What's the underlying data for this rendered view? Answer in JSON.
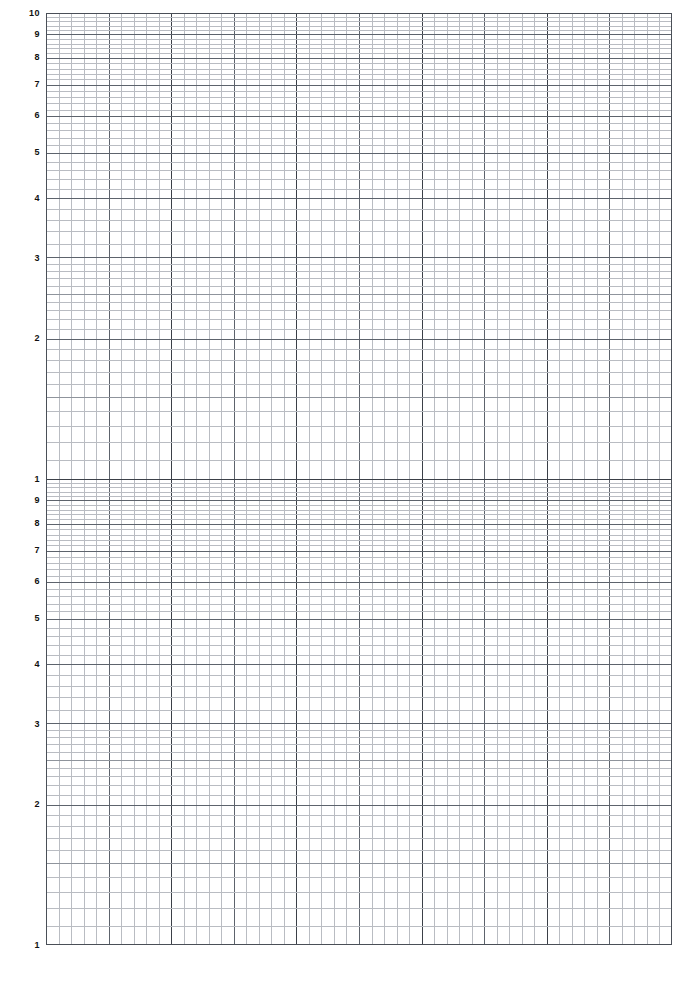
{
  "document": {
    "kind": "semi-logarithmic graph paper",
    "cycles": 2,
    "paper_color": "#ffffff"
  },
  "colors": {
    "paper": "#ffffff",
    "grid_minor": "#b9bcc2",
    "grid_mid": "#8f949c",
    "grid_major": "#5d636c",
    "grid_decade": "#3b4048",
    "border": "#4a4f57",
    "label": "#111111"
  },
  "plot": {
    "left": 46,
    "top": 13,
    "width": 626,
    "height": 932
  },
  "chart_data": {
    "type": "grid",
    "title": "",
    "subtitle": "",
    "xlabel": "",
    "ylabel": "",
    "grid": "on",
    "legend": "none",
    "annotations": [],
    "series": [],
    "x_axis": {
      "scale": "linear",
      "minor_divisions": 50,
      "major_every": 5,
      "tick_labels": []
    },
    "y_axis": {
      "scale": "log",
      "base": 10,
      "decades": 2,
      "range": [
        1,
        100
      ],
      "decade_breaks": [
        1,
        10,
        100
      ],
      "tick_labels": [
        {
          "text": "10",
          "value": 100,
          "y": 13
        },
        {
          "text": "9",
          "value": 90,
          "y": 34
        },
        {
          "text": "8",
          "value": 80,
          "y": 57
        },
        {
          "text": "7",
          "value": 70,
          "y": 84
        },
        {
          "text": "6",
          "value": 60,
          "y": 115
        },
        {
          "text": "5",
          "value": 50,
          "y": 152
        },
        {
          "text": "4",
          "value": 40,
          "y": 198
        },
        {
          "text": "3",
          "value": 30,
          "y": 258
        },
        {
          "text": "2",
          "value": 20,
          "y": 338
        },
        {
          "text": "1",
          "value": 10,
          "y": 479
        },
        {
          "text": "9",
          "value": 9,
          "y": 500
        },
        {
          "text": "8",
          "value": 8,
          "y": 523
        },
        {
          "text": "7",
          "value": 7,
          "y": 550
        },
        {
          "text": "6",
          "value": 6,
          "y": 581
        },
        {
          "text": "5",
          "value": 5,
          "y": 618
        },
        {
          "text": "4",
          "value": 4,
          "y": 664
        },
        {
          "text": "3",
          "value": 3,
          "y": 724
        },
        {
          "text": "2",
          "value": 2,
          "y": 804
        },
        {
          "text": "1",
          "value": 1,
          "y": 945
        }
      ]
    }
  }
}
